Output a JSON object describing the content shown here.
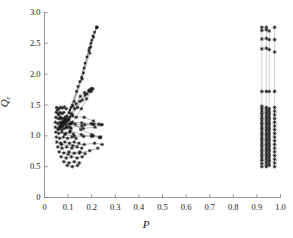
{
  "chart_data": {
    "type": "scatter",
    "title": "",
    "xlabel": "P",
    "ylabel": "Q",
    "ylabel_sub": "r",
    "xlabel_sub": "",
    "xlim": [
      0,
      1.0
    ],
    "ylim": [
      0,
      3.0
    ],
    "xticks": [
      0,
      0.1,
      0.2,
      0.3,
      0.4,
      0.5,
      0.6,
      0.7,
      0.8,
      0.9,
      1.0
    ],
    "xtick_labels": [
      "0",
      "0.1",
      "0.2",
      "0.3",
      "0.4",
      "0.5",
      "0.6",
      "0.7",
      "0.8",
      "0.9",
      "1.0"
    ],
    "yticks": [
      0,
      0.5,
      1.0,
      1.5,
      2.0,
      2.5,
      3.0
    ],
    "ytick_labels": [
      "0",
      "0.5",
      "1.0",
      "1.5",
      "2.0",
      "2.5",
      "3.0"
    ],
    "grid": false,
    "legend": null,
    "marker": "plus-star",
    "marker_color": "#1a1a1a",
    "line_color": "#6e6e6e",
    "axis_color": "#8a8a8a",
    "series": [
      {
        "name": "left-cluster-spokes",
        "comment": "long lines converging to apex near P=0.22, Q=2.75",
        "apex": [
          0.222,
          2.76
        ],
        "polylines": [
          [
            [
              0.222,
              2.76
            ],
            [
              0.205,
              2.62
            ],
            [
              0.188,
              2.38
            ],
            [
              0.158,
              1.95
            ],
            [
              0.118,
              1.5
            ],
            [
              0.088,
              1.28
            ],
            [
              0.072,
              1.2
            ]
          ],
          [
            [
              0.222,
              2.76
            ],
            [
              0.2,
              2.55
            ],
            [
              0.18,
              2.28
            ],
            [
              0.15,
              1.88
            ],
            [
              0.112,
              1.46
            ],
            [
              0.085,
              1.25
            ],
            [
              0.068,
              1.16
            ]
          ],
          [
            [
              0.222,
              2.76
            ],
            [
              0.212,
              2.68
            ],
            [
              0.196,
              2.44
            ],
            [
              0.165,
              2.02
            ],
            [
              0.126,
              1.56
            ],
            [
              0.094,
              1.32
            ],
            [
              0.075,
              1.22
            ]
          ],
          [
            [
              0.222,
              2.76
            ],
            [
              0.196,
              2.5
            ],
            [
              0.172,
              2.18
            ],
            [
              0.142,
              1.8
            ],
            [
              0.108,
              1.42
            ],
            [
              0.082,
              1.22
            ],
            [
              0.066,
              1.14
            ]
          ],
          [
            [
              0.222,
              2.76
            ],
            [
              0.208,
              2.6
            ],
            [
              0.192,
              2.34
            ],
            [
              0.16,
              1.92
            ],
            [
              0.12,
              1.48
            ],
            [
              0.09,
              1.26
            ],
            [
              0.07,
              1.18
            ]
          ],
          [
            [
              0.222,
              2.76
            ],
            [
              0.19,
              2.42
            ],
            [
              0.168,
              2.1
            ],
            [
              0.136,
              1.72
            ],
            [
              0.104,
              1.38
            ],
            [
              0.08,
              1.2
            ],
            [
              0.064,
              1.12
            ]
          ]
        ]
      },
      {
        "name": "left-cluster-mid-fan",
        "comment": "secondary fan peaking near P=0.20, Q=1.77",
        "polylines": [
          [
            [
              0.2,
              1.77
            ],
            [
              0.188,
              1.74
            ],
            [
              0.17,
              1.7
            ],
            [
              0.152,
              1.64
            ],
            [
              0.134,
              1.52
            ],
            [
              0.112,
              1.36
            ],
            [
              0.09,
              1.24
            ]
          ],
          [
            [
              0.205,
              1.76
            ],
            [
              0.19,
              1.72
            ],
            [
              0.172,
              1.66
            ],
            [
              0.15,
              1.56
            ],
            [
              0.128,
              1.44
            ],
            [
              0.106,
              1.3
            ],
            [
              0.086,
              1.2
            ]
          ],
          [
            [
              0.196,
              1.75
            ],
            [
              0.18,
              1.68
            ],
            [
              0.16,
              1.58
            ],
            [
              0.14,
              1.46
            ],
            [
              0.118,
              1.34
            ],
            [
              0.096,
              1.24
            ],
            [
              0.078,
              1.16
            ]
          ],
          [
            [
              0.198,
              1.72
            ],
            [
              0.178,
              1.6
            ],
            [
              0.156,
              1.44
            ],
            [
              0.134,
              1.3
            ],
            [
              0.112,
              1.2
            ],
            [
              0.092,
              1.14
            ],
            [
              0.074,
              1.1
            ]
          ]
        ]
      },
      {
        "name": "left-cluster-body",
        "comment": "dense tangle of short connected segments",
        "polylines": [
          [
            [
              0.052,
              1.46
            ],
            [
              0.06,
              1.44
            ],
            [
              0.068,
              1.46
            ],
            [
              0.076,
              1.45
            ],
            [
              0.084,
              1.47
            ],
            [
              0.092,
              1.44
            ]
          ],
          [
            [
              0.05,
              1.38
            ],
            [
              0.058,
              1.36
            ],
            [
              0.066,
              1.38
            ],
            [
              0.074,
              1.36
            ],
            [
              0.082,
              1.38
            ]
          ],
          [
            [
              0.048,
              1.3
            ],
            [
              0.058,
              1.28
            ],
            [
              0.068,
              1.3
            ],
            [
              0.078,
              1.28
            ],
            [
              0.088,
              1.3
            ],
            [
              0.098,
              1.27
            ]
          ],
          [
            [
              0.046,
              1.22
            ],
            [
              0.056,
              1.2
            ],
            [
              0.066,
              1.22
            ],
            [
              0.078,
              1.2
            ],
            [
              0.09,
              1.22
            ],
            [
              0.104,
              1.19
            ]
          ],
          [
            [
              0.046,
              1.14
            ],
            [
              0.058,
              1.12
            ],
            [
              0.07,
              1.14
            ],
            [
              0.084,
              1.12
            ],
            [
              0.098,
              1.14
            ],
            [
              0.112,
              1.12
            ]
          ],
          [
            [
              0.048,
              1.06
            ],
            [
              0.06,
              1.04
            ],
            [
              0.074,
              1.06
            ],
            [
              0.09,
              1.04
            ],
            [
              0.106,
              1.06
            ],
            [
              0.122,
              1.03
            ]
          ],
          [
            [
              0.05,
              0.98
            ],
            [
              0.064,
              0.96
            ],
            [
              0.08,
              0.98
            ],
            [
              0.098,
              0.96
            ],
            [
              0.116,
              0.98
            ],
            [
              0.134,
              0.96
            ]
          ],
          [
            [
              0.052,
              0.9
            ],
            [
              0.068,
              0.88
            ],
            [
              0.086,
              0.9
            ],
            [
              0.106,
              0.88
            ],
            [
              0.126,
              0.9
            ],
            [
              0.146,
              0.88
            ]
          ],
          [
            [
              0.056,
              0.82
            ],
            [
              0.074,
              0.8
            ],
            [
              0.094,
              0.82
            ],
            [
              0.116,
              0.8
            ],
            [
              0.138,
              0.82
            ],
            [
              0.158,
              0.8
            ]
          ],
          [
            [
              0.062,
              0.74
            ],
            [
              0.082,
              0.72
            ],
            [
              0.104,
              0.74
            ],
            [
              0.126,
              0.72
            ],
            [
              0.15,
              0.74
            ],
            [
              0.172,
              0.71
            ]
          ],
          [
            [
              0.07,
              0.66
            ],
            [
              0.092,
              0.64
            ],
            [
              0.114,
              0.66
            ],
            [
              0.138,
              0.64
            ],
            [
              0.16,
              0.66
            ]
          ],
          [
            [
              0.082,
              0.58
            ],
            [
              0.104,
              0.56
            ],
            [
              0.126,
              0.58
            ],
            [
              0.148,
              0.56
            ]
          ],
          [
            [
              0.096,
              0.52
            ],
            [
              0.118,
              0.5
            ],
            [
              0.14,
              0.52
            ]
          ],
          [
            [
              0.09,
              1.18
            ],
            [
              0.13,
              1.19
            ],
            [
              0.17,
              1.18
            ],
            [
              0.21,
              1.19
            ],
            [
              0.24,
              1.18
            ]
          ],
          [
            [
              0.086,
              1.02
            ],
            [
              0.126,
              1.0
            ],
            [
              0.166,
              0.99
            ],
            [
              0.206,
              1.0
            ],
            [
              0.236,
              0.98
            ]
          ],
          [
            [
              0.078,
              1.24
            ],
            [
              0.118,
              1.22
            ],
            [
              0.158,
              1.21
            ],
            [
              0.198,
              1.2
            ],
            [
              0.23,
              1.19
            ]
          ],
          [
            [
              0.064,
              1.16
            ],
            [
              0.11,
              1.08
            ],
            [
              0.156,
              1.02
            ],
            [
              0.2,
              0.99
            ],
            [
              0.234,
              0.97
            ]
          ],
          [
            [
              0.06,
              1.34
            ],
            [
              0.112,
              1.2
            ],
            [
              0.164,
              1.12
            ],
            [
              0.214,
              1.14
            ],
            [
              0.244,
              1.18
            ]
          ],
          [
            [
              0.054,
              1.42
            ],
            [
              0.104,
              1.26
            ],
            [
              0.154,
              1.1
            ],
            [
              0.2,
              1.02
            ],
            [
              0.238,
              0.98
            ]
          ],
          [
            [
              0.072,
              0.86
            ],
            [
              0.12,
              0.84
            ],
            [
              0.168,
              0.86
            ],
            [
              0.212,
              0.88
            ],
            [
              0.244,
              0.86
            ]
          ],
          [
            [
              0.1,
              0.7
            ],
            [
              0.148,
              0.72
            ],
            [
              0.192,
              0.76
            ],
            [
              0.226,
              0.8
            ]
          ],
          [
            [
              0.068,
              1.28
            ],
            [
              0.118,
              1.32
            ],
            [
              0.168,
              1.3
            ],
            [
              0.208,
              1.24
            ]
          ],
          [
            [
              0.058,
              1.1
            ],
            [
              0.108,
              1.14
            ],
            [
              0.158,
              1.16
            ],
            [
              0.206,
              1.18
            ]
          ]
        ]
      },
      {
        "name": "right-cluster-columns",
        "comment": "vertical stacks of markers at near-unity P",
        "columns": [
          {
            "p": 0.921,
            "q_values": [
              0.5,
              0.55,
              0.6,
              0.64,
              0.68,
              0.72,
              0.76,
              0.8,
              0.84,
              0.88,
              0.92,
              0.96,
              1.0,
              1.04,
              1.08,
              1.12,
              1.16,
              1.2,
              1.24,
              1.28,
              1.32,
              1.36,
              1.4,
              1.44,
              1.48,
              1.72,
              2.41,
              2.57,
              2.71,
              2.76
            ]
          },
          {
            "p": 0.94,
            "q_values": [
              0.5,
              0.54,
              0.58,
              0.62,
              0.66,
              0.7,
              0.74,
              0.78,
              0.82,
              0.86,
              0.9,
              0.94,
              0.98,
              1.02,
              1.06,
              1.1,
              1.14,
              1.18,
              1.22,
              1.26,
              1.3,
              1.34,
              1.38,
              1.42,
              1.46,
              1.72,
              2.42,
              2.58,
              2.72,
              2.76
            ]
          },
          {
            "p": 0.952,
            "q_values": [
              0.52,
              0.56,
              0.6,
              0.64,
              0.68,
              0.72,
              0.76,
              0.8,
              0.84,
              0.88,
              0.92,
              0.96,
              1.0,
              1.04,
              1.08,
              1.12,
              1.16,
              1.2,
              1.24,
              1.28,
              1.32,
              1.36,
              1.4,
              1.44,
              1.72,
              2.4,
              2.56,
              2.7
            ]
          },
          {
            "p": 0.975,
            "q_values": [
              0.5,
              0.56,
              0.62,
              0.68,
              0.74,
              0.8,
              0.86,
              0.92,
              0.98,
              1.04,
              1.1,
              1.16,
              1.22,
              1.28,
              1.34,
              1.4,
              1.46,
              1.72,
              2.36,
              2.56,
              2.76
            ]
          }
        ],
        "vertical_connectors": [
          {
            "p": 0.921,
            "q_from": 0.5,
            "q_to": 2.76
          },
          {
            "p": 0.94,
            "q_from": 0.5,
            "q_to": 2.76
          },
          {
            "p": 0.952,
            "q_from": 0.52,
            "q_to": 2.7
          },
          {
            "p": 0.975,
            "q_from": 0.5,
            "q_to": 2.76
          }
        ]
      }
    ]
  }
}
